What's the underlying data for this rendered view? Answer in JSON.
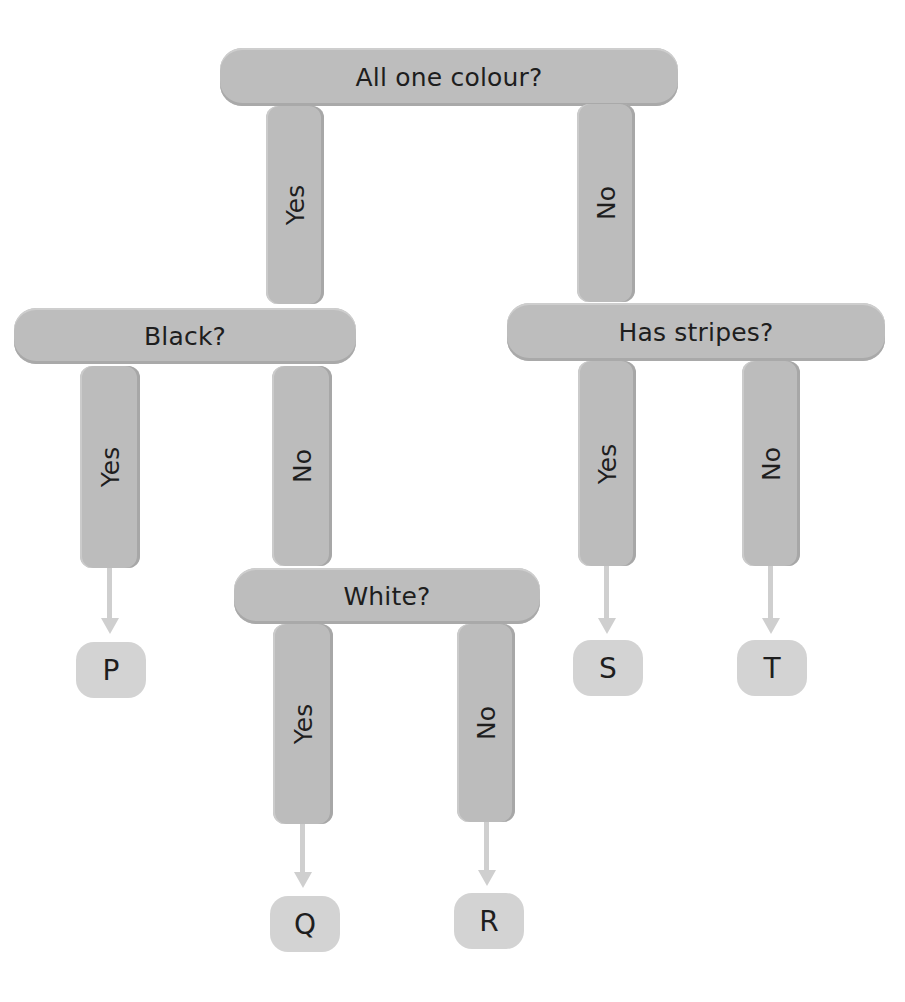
{
  "diagram": {
    "type": "decision-tree",
    "nodes": {
      "root": {
        "question": "All one colour?"
      },
      "black": {
        "question": "Black?"
      },
      "stripes": {
        "question": "Has stripes?"
      },
      "white": {
        "question": "White?"
      }
    },
    "branches": {
      "root_yes": "Yes",
      "root_no": "No",
      "black_yes": "Yes",
      "black_no": "No",
      "stripes_yes": "Yes",
      "stripes_no": "No",
      "white_yes": "Yes",
      "white_no": "No"
    },
    "leaves": {
      "p": "P",
      "q": "Q",
      "r": "R",
      "s": "S",
      "t": "T"
    },
    "colors": {
      "node_fill": "#bdbdbd",
      "leaf_fill": "#d3d3d3",
      "arrow": "#cfcfcf",
      "text": "#1e1e1e"
    }
  }
}
